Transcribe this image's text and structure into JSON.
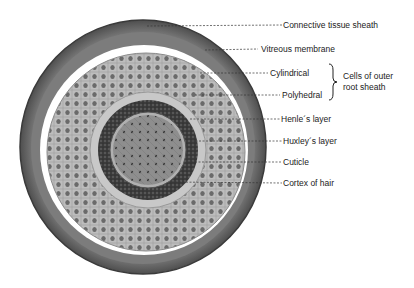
{
  "figure": {
    "labels": [
      {
        "id": "connective-tissue-sheath",
        "text": "Connective tissue sheath"
      },
      {
        "id": "vitreous-membrane",
        "text": "Vitreous membrane"
      },
      {
        "id": "cylindrical",
        "text": "Cylindrical"
      },
      {
        "id": "polyhedral",
        "text": "Polyhedral"
      },
      {
        "id": "henles-layer",
        "text": "Henle´s layer"
      },
      {
        "id": "huxleys-layer",
        "text": "Huxley´s layer"
      },
      {
        "id": "cuticle",
        "text": "Cuticle"
      },
      {
        "id": "cortex-of-hair",
        "text": "Cortex of hair"
      }
    ],
    "group_label": {
      "line1": "Cells of outer",
      "line2": "root sheath"
    },
    "colors": {
      "sheath": "#6e6e6e",
      "outer_root_sheath": "#b5b5b5",
      "henle_huxley": "#3a3a3a",
      "cortex": "#8a8a8a",
      "text": "#222222"
    }
  }
}
